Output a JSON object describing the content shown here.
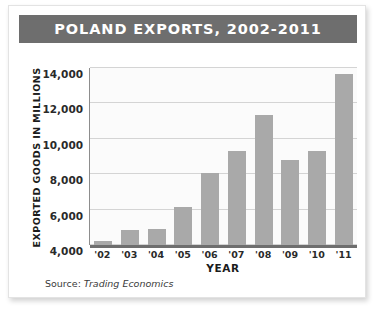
{
  "chart_data": {
    "type": "bar",
    "title": "POLAND EXPORTS, 2002-2011",
    "xlabel": "YEAR",
    "ylabel": "EXPORTED GOODS IN MILLIONS",
    "categories": [
      "'02",
      "'03",
      "'04",
      "'05",
      "'06",
      "'07",
      "'08",
      "'09",
      "'10",
      "'11"
    ],
    "values": [
      4250,
      4850,
      4900,
      6150,
      8050,
      9300,
      11350,
      8800,
      9300,
      13650
    ],
    "ylim": [
      4000,
      14000
    ],
    "yticks": [
      "4,000",
      "6,000",
      "8,000",
      "10,000",
      "12,000",
      "14,000"
    ],
    "ytick_values": [
      4000,
      6000,
      8000,
      10000,
      12000,
      14000
    ],
    "grid": true,
    "legend": "none",
    "bar_color": "#a9a9a9",
    "title_bg_color": "#6e6e6e",
    "title_text_color": "#ffffff",
    "grid_color": "#d4d4d4",
    "axis_color": "#6e6e6e"
  },
  "footer": {
    "source_prefix": "Source: ",
    "source_name": "Trading Economics"
  }
}
